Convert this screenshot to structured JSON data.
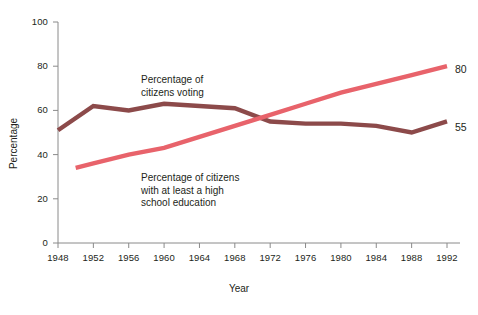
{
  "chart_data": {
    "type": "line",
    "title": "",
    "subtitle": "",
    "xlabel": "Year",
    "ylabel": "Percentage",
    "xlim": [
      1948,
      1992
    ],
    "ylim": [
      0,
      100
    ],
    "grid": false,
    "legend_position": "inline-annotations",
    "x": [
      1948,
      1952,
      1956,
      1960,
      1964,
      1968,
      1972,
      1976,
      1980,
      1984,
      1988,
      1992
    ],
    "xticks": [
      "1948",
      "1952",
      "1956",
      "1960",
      "1964",
      "1968",
      "1972",
      "1976",
      "1980",
      "1984",
      "1988",
      "1992"
    ],
    "yticks": [
      "0",
      "20",
      "40",
      "60",
      "80",
      "100"
    ],
    "ytick_values": [
      0,
      20,
      40,
      60,
      80,
      100
    ],
    "series": [
      {
        "name": "Percentage of citizens voting",
        "color": "#8c4a4a",
        "x": [
          1948,
          1952,
          1956,
          1960,
          1964,
          1968,
          1972,
          1976,
          1980,
          1984,
          1988,
          1992
        ],
        "values": [
          51,
          62,
          60,
          63,
          62,
          61,
          55,
          54,
          54,
          53,
          50,
          55
        ],
        "end_label": "55"
      },
      {
        "name": "Percentage of citizens with at least a high school education",
        "color": "#e8636b",
        "x": [
          1950,
          1952,
          1956,
          1960,
          1964,
          1968,
          1972,
          1976,
          1980,
          1984,
          1988,
          1992
        ],
        "values": [
          34,
          36,
          40,
          43,
          48,
          53,
          58,
          63,
          68,
          72,
          76,
          80
        ],
        "end_label": "80"
      }
    ],
    "annotations": [
      {
        "id": "voting",
        "text": "Percentage of\ncitizens voting"
      },
      {
        "id": "education",
        "text": "Percentage of citizens\nwith at least a high\nschool education"
      }
    ]
  },
  "axis": {
    "x_title": "Year",
    "y_title": "Percentage"
  },
  "colors": {
    "voting_line": "#8c4a4a",
    "education_line": "#e8636b",
    "axis": "#8a8a8a",
    "text": "#231f20",
    "background": "#ffffff"
  }
}
